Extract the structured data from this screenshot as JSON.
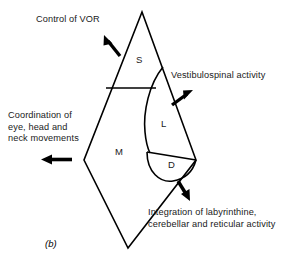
{
  "figure": {
    "caption": "(b)",
    "background_color": "#ffffff",
    "line_color": "#000000",
    "text_color": "#1a1a1a"
  },
  "regions": [
    {
      "id": "S",
      "letter": "S"
    },
    {
      "id": "L",
      "letter": "L"
    },
    {
      "id": "M",
      "letter": "M"
    },
    {
      "id": "D",
      "letter": "D"
    }
  ],
  "annotations": [
    {
      "id": "control-of-vor",
      "text": "Control of VOR",
      "arrow_direction": "up-left"
    },
    {
      "id": "vestibulospinal-activity",
      "text": "Vestibulospinal activity",
      "arrow_direction": "up-right"
    },
    {
      "id": "coordination-of-eye-head-neck",
      "text": "Coordination of\neye, head and\nneck movements",
      "arrow_direction": "left"
    },
    {
      "id": "integration-of-labyrinthine",
      "text": "Integration of labyrinthine,\ncerebellar and reticular activity",
      "arrow_direction": "down-right"
    }
  ]
}
